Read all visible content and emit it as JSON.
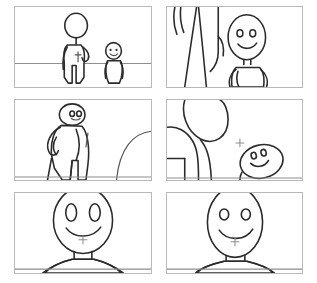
{
  "storyboard": {
    "title": "Storyboard",
    "layout": {
      "columns": 2,
      "rows": 3,
      "panel_count": 6
    },
    "colors": {
      "background": "#ffffff",
      "panel_fill": "#ffffff",
      "panel_border": "#b9b9b9",
      "ink": "#2b2b2b",
      "ink_light": "#8e8e8e"
    },
    "panels": [
      {
        "index": 1,
        "name": "panel-1-wide-two-figures",
        "shot": "wide shot",
        "caption": "Tall figure standing with hand on hip beside a short figure on a horizon line",
        "characters": [
          "tall-figure",
          "small-figure"
        ],
        "features": [
          "horizon-line",
          "hand-on-hip",
          "smiling-small-figure"
        ]
      },
      {
        "index": 2,
        "name": "panel-2-low-angle-legs",
        "shot": "low angle close shot",
        "caption": "Close on the tall figure's legs at left while the small figure stands at right with visible face",
        "characters": [
          "tall-figure-legs",
          "small-figure"
        ],
        "features": [
          "cropped-legs",
          "arm-on-hip",
          "two-dot-eyes",
          "smile"
        ]
      },
      {
        "index": 3,
        "name": "panel-3-rear-view",
        "shot": "medium rear shot",
        "caption": "Figure seen from behind, head turned to camera, hand on hip; a large rounded form enters from right",
        "characters": [
          "turning-figure",
          "foreground-form"
        ],
        "features": [
          "back-view",
          "head-turned",
          "two-eyes",
          "large-arc-right"
        ]
      },
      {
        "index": 4,
        "name": "panel-4-over-shoulder",
        "shot": "over the shoulder close shot",
        "caption": "Back of large head and shoulder fills the left; small smiling head at lower right",
        "characters": [
          "large-head-back",
          "small-figure"
        ],
        "features": [
          "blank-back-of-head",
          "shoulder",
          "tilted-egg-head",
          "smile"
        ]
      },
      {
        "index": 5,
        "name": "panel-5-closeup-face-a",
        "shot": "close up",
        "caption": "Large smiling face centered with tall oval eyes, neck and shoulders below",
        "characters": [
          "figure-a"
        ],
        "features": [
          "oval-eyes",
          "curved-smile",
          "neck",
          "shoulders",
          "ground-line"
        ]
      },
      {
        "index": 6,
        "name": "panel-6-closeup-face-b",
        "shot": "close up",
        "caption": "Egg shaped smiling head with round eyes, neck and shoulders below",
        "characters": [
          "figure-b"
        ],
        "features": [
          "round-eyes",
          "curved-smile",
          "neck",
          "shoulders",
          "ground-line"
        ]
      }
    ]
  }
}
